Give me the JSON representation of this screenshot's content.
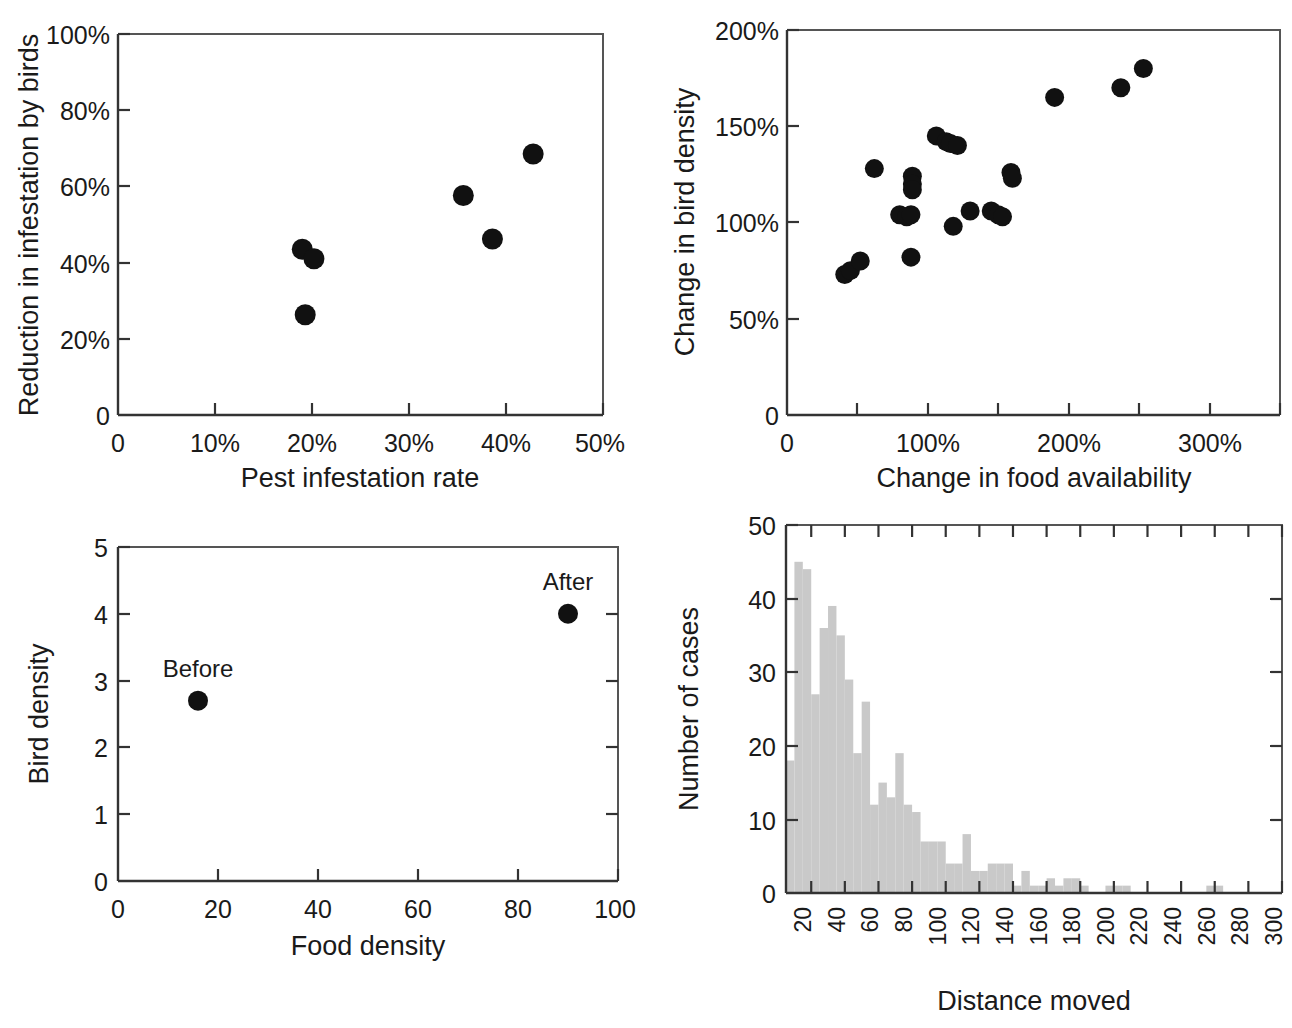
{
  "figure": {
    "title": "",
    "panel_count": 4
  },
  "chart_data": [
    {
      "id": "panel-a",
      "type": "scatter",
      "title": "",
      "xlabel": "Pest infestation rate",
      "ylabel": "Reduction in infestation by birds",
      "xlim": [
        0,
        50
      ],
      "ylim": [
        0,
        100
      ],
      "xticks": [
        0,
        10,
        20,
        30,
        40,
        50
      ],
      "xtick_labels": [
        "0",
        "10%",
        "20%",
        "30%",
        "40%",
        "50%"
      ],
      "yticks": [
        0,
        20,
        40,
        60,
        80,
        100
      ],
      "ytick_labels": [
        "0",
        "20%",
        "40%",
        "60%",
        "80%",
        "100%"
      ],
      "grid": false,
      "legend": "none",
      "marker_color": "#111111",
      "points": [
        {
          "x": 19.0,
          "y": 43.5
        },
        {
          "x": 20.2,
          "y": 41.0
        },
        {
          "x": 19.3,
          "y": 26.3
        },
        {
          "x": 35.6,
          "y": 57.6
        },
        {
          "x": 38.6,
          "y": 46.2
        },
        {
          "x": 42.8,
          "y": 68.5
        }
      ]
    },
    {
      "id": "panel-b",
      "type": "scatter",
      "title": "",
      "xlabel": "Change in food availability",
      "ylabel": "Change in bird density",
      "xlim": [
        0,
        350
      ],
      "ylim": [
        0,
        200
      ],
      "xticks": [
        0,
        50,
        100,
        150,
        200,
        250,
        300,
        350
      ],
      "xtick_labels": [
        "0",
        "",
        "100%",
        "",
        "200%",
        "",
        "300%",
        ""
      ],
      "yticks": [
        0,
        50,
        100,
        150,
        200
      ],
      "ytick_labels": [
        "0",
        "50%",
        "100%",
        "150%",
        "200%"
      ],
      "grid": false,
      "legend": "none",
      "marker_color": "#111111",
      "points": [
        {
          "x": 41,
          "y": 73
        },
        {
          "x": 45,
          "y": 75
        },
        {
          "x": 52,
          "y": 80
        },
        {
          "x": 62,
          "y": 128
        },
        {
          "x": 80,
          "y": 104
        },
        {
          "x": 85,
          "y": 103
        },
        {
          "x": 88,
          "y": 104
        },
        {
          "x": 88,
          "y": 82
        },
        {
          "x": 89,
          "y": 124
        },
        {
          "x": 89,
          "y": 120
        },
        {
          "x": 89,
          "y": 117
        },
        {
          "x": 106,
          "y": 145
        },
        {
          "x": 113,
          "y": 142
        },
        {
          "x": 116,
          "y": 141
        },
        {
          "x": 118,
          "y": 98
        },
        {
          "x": 121,
          "y": 140
        },
        {
          "x": 130,
          "y": 106
        },
        {
          "x": 145,
          "y": 106
        },
        {
          "x": 150,
          "y": 104
        },
        {
          "x": 153,
          "y": 103
        },
        {
          "x": 159,
          "y": 126
        },
        {
          "x": 160,
          "y": 123
        },
        {
          "x": 190,
          "y": 165
        },
        {
          "x": 237,
          "y": 170
        },
        {
          "x": 253,
          "y": 180
        }
      ]
    },
    {
      "id": "panel-c",
      "type": "scatter",
      "title": "",
      "xlabel": "Food density",
      "ylabel": "Bird density",
      "xlim": [
        0,
        100
      ],
      "ylim": [
        0,
        5
      ],
      "xticks": [
        0,
        20,
        40,
        60,
        80,
        100
      ],
      "xtick_labels": [
        "0",
        "20",
        "40",
        "60",
        "80",
        "100"
      ],
      "yticks": [
        0,
        1,
        2,
        3,
        4,
        5
      ],
      "ytick_labels": [
        "0",
        "1",
        "2",
        "3",
        "4",
        "5"
      ],
      "grid": false,
      "legend": "none",
      "marker_color": "#111111",
      "points": [
        {
          "x": 16,
          "y": 2.7,
          "label": "Before"
        },
        {
          "x": 90,
          "y": 4.0,
          "label": "After"
        }
      ]
    },
    {
      "id": "panel-d",
      "type": "bar",
      "title": "",
      "xlabel": "Distance moved",
      "ylabel": "Number of cases",
      "xlim": [
        5,
        300
      ],
      "ylim": [
        0,
        50
      ],
      "xticks": [
        20,
        40,
        60,
        80,
        100,
        120,
        140,
        160,
        180,
        200,
        220,
        240,
        260,
        280,
        300
      ],
      "xtick_labels": [
        "20",
        "40",
        "60",
        "80",
        "100",
        "120",
        "140",
        "160",
        "180",
        "200",
        "220",
        "240",
        "260",
        "280",
        "300"
      ],
      "yticks": [
        0,
        10,
        20,
        30,
        40,
        50
      ],
      "ytick_labels": [
        "0",
        "10",
        "20",
        "30",
        "40",
        "50"
      ],
      "grid": false,
      "legend": "none",
      "bar_color": "#c9c9c9",
      "bin_width": 5,
      "categories": [
        7.5,
        12.5,
        17.5,
        22.5,
        27.5,
        32.5,
        37.5,
        42.5,
        47.5,
        52.5,
        57.5,
        62.5,
        67.5,
        72.5,
        77.5,
        82.5,
        87.5,
        92.5,
        97.5,
        102.5,
        107.5,
        112.5,
        117.5,
        122.5,
        127.5,
        132.5,
        137.5,
        142.5,
        147.5,
        152.5,
        157.5,
        162.5,
        167.5,
        172.5,
        177.5,
        182.5,
        187.5,
        192.5,
        197.5,
        202.5,
        207.5,
        212.5,
        217.5,
        222.5,
        227.5,
        232.5,
        237.5,
        242.5,
        247.5,
        252.5,
        257.5,
        262.5,
        267.5,
        272.5,
        277.5,
        282.5,
        287.5,
        292.5,
        297.5
      ],
      "values": [
        18,
        45,
        44,
        27,
        36,
        39,
        35,
        29,
        19,
        26,
        12,
        15,
        13,
        19,
        12,
        11,
        7,
        7,
        7,
        4,
        4,
        8,
        3,
        3,
        4,
        4,
        4,
        1,
        3,
        1,
        1,
        2,
        1,
        2,
        2,
        1,
        0,
        0,
        1,
        1,
        1,
        0,
        0,
        0,
        0,
        0,
        0,
        0,
        0,
        0,
        1,
        1,
        0,
        0,
        0,
        0,
        0,
        0,
        0
      ]
    }
  ]
}
